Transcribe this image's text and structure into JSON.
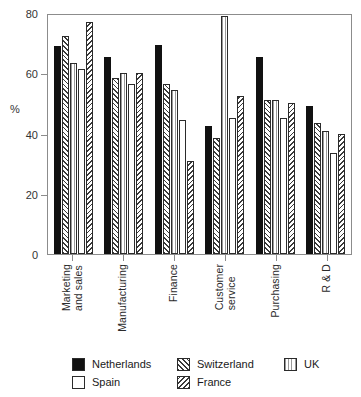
{
  "chart_data": {
    "type": "bar",
    "title": "",
    "xlabel": "",
    "ylabel": "%",
    "ylim": [
      0,
      80
    ],
    "yticks": [
      0,
      20,
      40,
      60,
      80
    ],
    "grid": false,
    "legend_position": "bottom",
    "categories": [
      "Marketing\nand sales",
      "Manufacturing",
      "Finance",
      "Customer\nservice",
      "Purchasing",
      "R & D"
    ],
    "series": [
      {
        "name": "Netherlands",
        "pattern": "solid-black",
        "values": [
          69,
          65.5,
          69.5,
          42.5,
          65.5,
          49
        ]
      },
      {
        "name": "Switzerland",
        "pattern": "forward-diagonal-hatch",
        "values": [
          72.5,
          58.5,
          56.5,
          38.5,
          51,
          43.5
        ]
      },
      {
        "name": "UK",
        "pattern": "vertical-lines",
        "values": [
          63.5,
          60,
          54.5,
          79,
          51,
          41
        ]
      },
      {
        "name": "Spain",
        "pattern": "empty-white",
        "values": [
          61.5,
          56.5,
          44.5,
          45,
          45,
          33.5
        ]
      },
      {
        "name": "France",
        "pattern": "backward-diagonal-hatch",
        "values": [
          77,
          60,
          31,
          52.5,
          50,
          40
        ]
      }
    ]
  },
  "axis": {
    "y_title": "%",
    "y_tick_labels": [
      "80",
      "60",
      "40",
      "20",
      "0"
    ]
  },
  "legend": {
    "entries": [
      {
        "label": "Netherlands",
        "pattern": "solid-black"
      },
      {
        "label": "Switzerland",
        "pattern": "forward-diagonal-hatch"
      },
      {
        "label": "UK",
        "pattern": "vertical-lines"
      },
      {
        "label": "Spain",
        "pattern": "empty-white"
      },
      {
        "label": "France",
        "pattern": "backward-diagonal-hatch"
      }
    ]
  },
  "colors": {
    "bar_outline": "#2b2b2b",
    "solid_fill": "#111111",
    "hatch_stroke": "#3a3a3a",
    "vline_stroke": "#9a9a9a",
    "axis": "#8c8c8c",
    "text": "#1a1a1a"
  }
}
